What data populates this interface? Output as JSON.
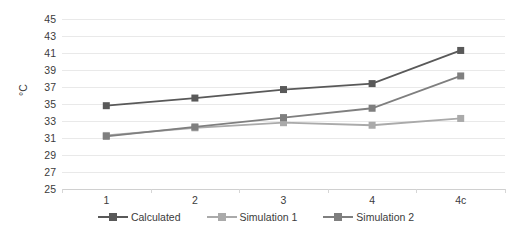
{
  "chart_data": {
    "type": "line",
    "title": "",
    "xlabel": "",
    "ylabel": "°C",
    "categories": [
      "1",
      "2",
      "3",
      "4",
      "4c"
    ],
    "ylim": [
      25,
      45
    ],
    "yticks": [
      25,
      27,
      29,
      31,
      33,
      35,
      37,
      39,
      41,
      43,
      45
    ],
    "grid": true,
    "legend_position": "bottom",
    "series": [
      {
        "name": "Calculated",
        "color": "#595959",
        "marker": "square",
        "values": [
          34.8,
          35.7,
          36.7,
          37.4,
          41.3
        ]
      },
      {
        "name": "Simulation 1",
        "color": "#aaaaaa",
        "marker": "square",
        "values": [
          31.3,
          32.2,
          32.8,
          32.5,
          33.3
        ]
      },
      {
        "name": "Simulation 2",
        "color": "#7f7f7f",
        "marker": "square",
        "values": [
          31.2,
          32.3,
          33.4,
          34.5,
          38.3
        ]
      }
    ]
  },
  "axes": {
    "y_tick_labels": [
      "45",
      "43",
      "41",
      "39",
      "37",
      "35",
      "33",
      "31",
      "29",
      "27",
      "25"
    ],
    "y_axis_title": "°C",
    "x_tick_labels": [
      "1",
      "2",
      "3",
      "4",
      "4c"
    ]
  },
  "legend": {
    "items": [
      {
        "label": "Calculated",
        "color": "#595959"
      },
      {
        "label": "Simulation 1",
        "color": "#aaaaaa"
      },
      {
        "label": "Simulation 2",
        "color": "#7f7f7f"
      }
    ]
  },
  "colors": {
    "gridline": "#e9e9e9",
    "axis": "#d0d0d0",
    "text": "#3b3b3b",
    "background": "#ffffff"
  }
}
